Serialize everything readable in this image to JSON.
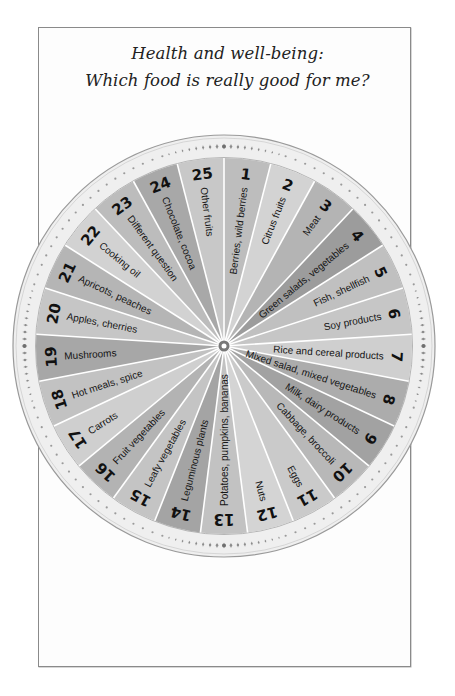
{
  "title": {
    "line1": "Health and well-being:",
    "line2": "Which food is really good for me?"
  },
  "wheel": {
    "center": [
      224,
      346
    ],
    "outer_radius": 211,
    "inner_radius": 188,
    "number_radius": 173,
    "label_outer_radius": 160,
    "hub_color": "#777777",
    "divider_color": "#ffffff",
    "ring_color": "#efefef",
    "ring_border_color": "#9a9a9a",
    "ornament_color": "#8c8c8c",
    "segments": [
      {
        "number": "1",
        "label": "Berries, wild berries",
        "shade": "#bdbdbd"
      },
      {
        "number": "2",
        "label": "Citrus fruits",
        "shade": "#d3d3d3"
      },
      {
        "number": "3",
        "label": "Meat",
        "shade": "#b4b4b4"
      },
      {
        "number": "4",
        "label": "Green salads, vegetables",
        "shade": "#9c9c9c"
      },
      {
        "number": "5",
        "label": "Fish, shellfish",
        "shade": "#c0c0c0"
      },
      {
        "number": "6",
        "label": "Soy products",
        "shade": "#c6c6c6"
      },
      {
        "number": "7",
        "label": "Rice and cereal products",
        "shade": "#cfcfcf"
      },
      {
        "number": "8",
        "label": "Mixed salad, mixed vegetables",
        "shade": "#acacac"
      },
      {
        "number": "9",
        "label": "Milk, dairy products",
        "shade": "#a2a2a2"
      },
      {
        "number": "10",
        "label": "Cabbage, broccoli",
        "shade": "#b8b8b8"
      },
      {
        "number": "11",
        "label": "Eggs",
        "shade": "#cacaca"
      },
      {
        "number": "12",
        "label": "Nuts",
        "shade": "#d4d4d4"
      },
      {
        "number": "13",
        "label": "Potatoes, pumpkins, bananas",
        "shade": "#c2c2c2"
      },
      {
        "number": "14",
        "label": "Leguminous plants",
        "shade": "#a4a4a4"
      },
      {
        "number": "15",
        "label": "Leafy vegetables",
        "shade": "#c4c4c4"
      },
      {
        "number": "16",
        "label": "Fruit vegetables",
        "shade": "#b3b3b3"
      },
      {
        "number": "17",
        "label": "Carrots",
        "shade": "#cfcfcf"
      },
      {
        "number": "18",
        "label": "Hot meals, spice",
        "shade": "#c2c2c2"
      },
      {
        "number": "19",
        "label": "Mushrooms",
        "shade": "#a7a7a7"
      },
      {
        "number": "20",
        "label": "Apples, cherries",
        "shade": "#c6c6c6"
      },
      {
        "number": "21",
        "label": "Apricots, peaches",
        "shade": "#b5b5b5"
      },
      {
        "number": "22",
        "label": "Cooking oil",
        "shade": "#d2d2d2"
      },
      {
        "number": "23",
        "label": "Different question",
        "shade": "#bcbcbc"
      },
      {
        "number": "24",
        "label": "Chocolate, cocoa",
        "shade": "#a8a8a8"
      },
      {
        "number": "25",
        "label": "Other fruits",
        "shade": "#c8c8c8"
      }
    ]
  }
}
